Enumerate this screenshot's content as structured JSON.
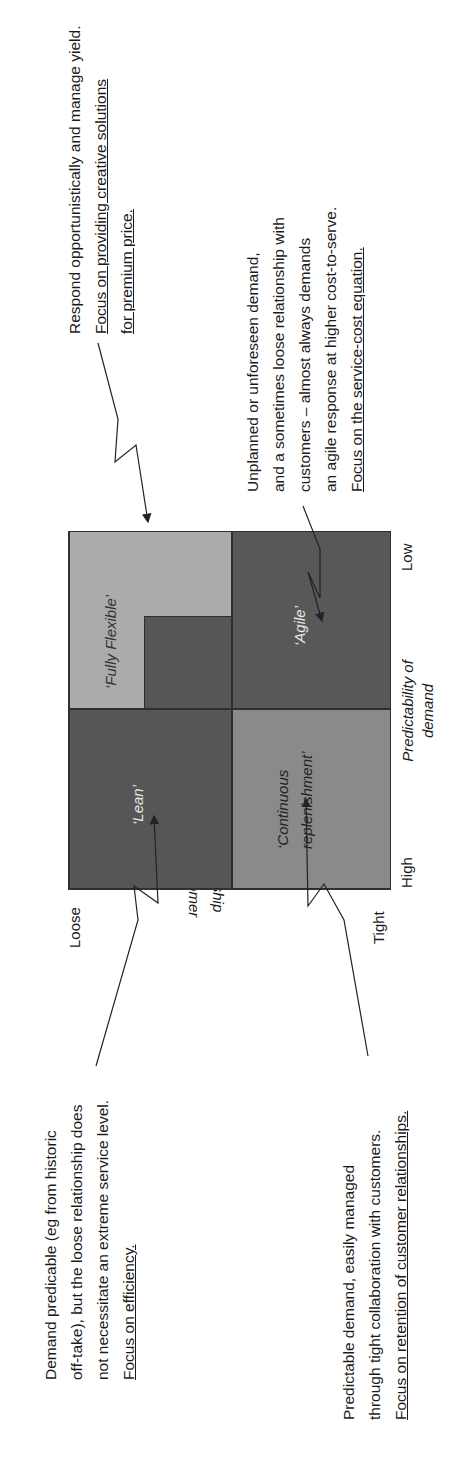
{
  "quadrants": {
    "lean": {
      "label": "‘Lean’",
      "color": "#565656"
    },
    "fully_flexible": {
      "label": "‘Fully Flexible’",
      "color": "#ababab",
      "inner_color": "#565656"
    },
    "continuous": {
      "label_line1": "‘Continuous",
      "label_line2": "replenishment’",
      "color": "#8a8a8a"
    },
    "agile": {
      "label": "‘Agile’",
      "color": "#585858"
    }
  },
  "axes": {
    "y_label_top": "Loose",
    "y_label_bottom": "Tight",
    "y_title_line1": "Relationship",
    "y_title_line2": "with customer",
    "x_label_left": "High",
    "x_label_right": "Low",
    "x_title_line1": "Predictability of",
    "x_title_line2": "demand"
  },
  "notes": {
    "fully_flexible": {
      "line1": "Respond opportunistically and manage yield.",
      "line2": "Focus on providing creative solutions",
      "line3": "for premium price."
    },
    "agile": {
      "line1": "Unplanned or unforeseen demand,",
      "line2": "and a sometimes loose relationship with",
      "line3": "customers – almost always demands",
      "line4": "an agile response at higher cost-to-serve.",
      "line5": "Focus on the service-cost equation."
    },
    "lean": {
      "line1": "Demand predicable (eg from historic",
      "line2": "off-take), but the loose relationship does",
      "line3": "not necessitate an extreme service level.",
      "line4": "Focus on efficiency."
    },
    "continuous": {
      "line1": "Predictable demand, easily managed",
      "line2": "through tight collaboration with customers.",
      "line3": "Focus on retention of customer relationships."
    }
  }
}
